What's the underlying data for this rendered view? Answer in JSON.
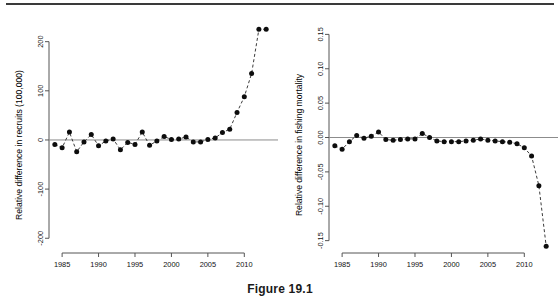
{
  "figure": {
    "caption": "Figure 19.1"
  },
  "chart_data": [
    {
      "type": "line",
      "panel": "left",
      "title": "",
      "xlabel": "",
      "ylabel": "Relative difference in recruits (100,000)",
      "xlim": [
        1983.2,
        2013.8
      ],
      "ylim": [
        -230,
        240
      ],
      "xticks": [
        1985,
        1990,
        1995,
        2000,
        2005,
        2010
      ],
      "yticks": [
        -200,
        -100,
        0,
        100,
        200
      ],
      "ytick_labels": [
        "-200",
        "-100",
        "0",
        "100",
        "200"
      ],
      "grid": false,
      "legend": null,
      "reference_line": 0,
      "marker": "filled-circle",
      "linestyle": "dashed",
      "x": [
        1984,
        1985,
        1986,
        1987,
        1988,
        1989,
        1990,
        1991,
        1992,
        1993,
        1994,
        1995,
        1996,
        1997,
        1998,
        1999,
        2000,
        2001,
        2002,
        2003,
        2004,
        2005,
        2006,
        2007,
        2008,
        2009,
        2010,
        2011,
        2012,
        2013
      ],
      "values": [
        -9,
        -16,
        16,
        -24,
        -4,
        11,
        -12,
        -2,
        2,
        -20,
        -5,
        -9,
        16,
        -11,
        -2,
        7,
        1,
        2,
        6,
        -4,
        -4,
        1,
        4,
        15,
        22,
        56,
        88,
        135,
        225,
        225
      ]
    },
    {
      "type": "line",
      "panel": "right",
      "title": "",
      "xlabel": "",
      "ylabel": "Relative difference in fishing mortality",
      "xlim": [
        1983.2,
        2013.8
      ],
      "ylim": [
        -0.168,
        0.168
      ],
      "xticks": [
        1985,
        1990,
        1995,
        2000,
        2005,
        2010
      ],
      "yticks": [
        -0.15,
        -0.1,
        -0.05,
        0.0,
        0.05,
        0.1,
        0.15
      ],
      "ytick_labels": [
        "-0.15",
        "-0.10",
        "-0.05",
        "0.00",
        "0.05",
        "0.10",
        "0.15"
      ],
      "grid": false,
      "legend": null,
      "reference_line": 0,
      "marker": "filled-circle",
      "linestyle": "dashed",
      "x": [
        1984,
        1985,
        1986,
        1987,
        1988,
        1989,
        1990,
        1991,
        1992,
        1993,
        1994,
        1995,
        1996,
        1997,
        1998,
        1999,
        2000,
        2001,
        2002,
        2003,
        2004,
        2005,
        2006,
        2007,
        2008,
        2009,
        2010,
        2011,
        2012,
        2013
      ],
      "values": [
        -0.012,
        -0.017,
        -0.006,
        0.003,
        -0.001,
        0.002,
        0.008,
        -0.003,
        -0.004,
        -0.003,
        -0.002,
        -0.002,
        0.006,
        0.0,
        -0.005,
        -0.006,
        -0.006,
        -0.006,
        -0.005,
        -0.004,
        -0.002,
        -0.004,
        -0.005,
        -0.006,
        -0.007,
        -0.009,
        -0.015,
        -0.027,
        -0.07,
        -0.158
      ]
    }
  ],
  "style": {
    "axis_color": "#555555",
    "marker_color": "#0d0d0d",
    "line_color": "#3c3c3c",
    "reference_line_color": "#8c8c8c",
    "rule_color": "#3a3a3a"
  }
}
